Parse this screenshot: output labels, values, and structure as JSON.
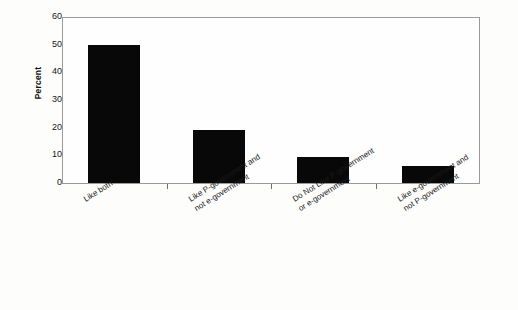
{
  "chart_data": {
    "type": "bar",
    "title": "",
    "subtitle": "",
    "xlabel": "",
    "ylabel": "Percent",
    "ylim": [
      0,
      60
    ],
    "yticks": [
      0,
      10,
      20,
      30,
      40,
      50,
      60
    ],
    "ytick_labels": [
      "0",
      "10",
      "20",
      "30",
      "40",
      "50",
      "60"
    ],
    "grid": false,
    "legend": false,
    "bar_color": "#080808",
    "frame_color": "#9a9a9a",
    "categories": [
      "Like both",
      "Like P-government and not e-government",
      "Do Not Like P-government or e-government",
      "Like e-government and not P-government"
    ],
    "category_lines": [
      [
        "Like both"
      ],
      [
        "Like P-government and",
        "not e-government"
      ],
      [
        "Do Not Like P-government",
        "or e-government"
      ],
      [
        "Like e-government and",
        "not P-government"
      ]
    ],
    "values": [
      50,
      19,
      9.5,
      6
    ],
    "value_labels": [
      "50",
      "19",
      "9.5",
      "6"
    ]
  }
}
